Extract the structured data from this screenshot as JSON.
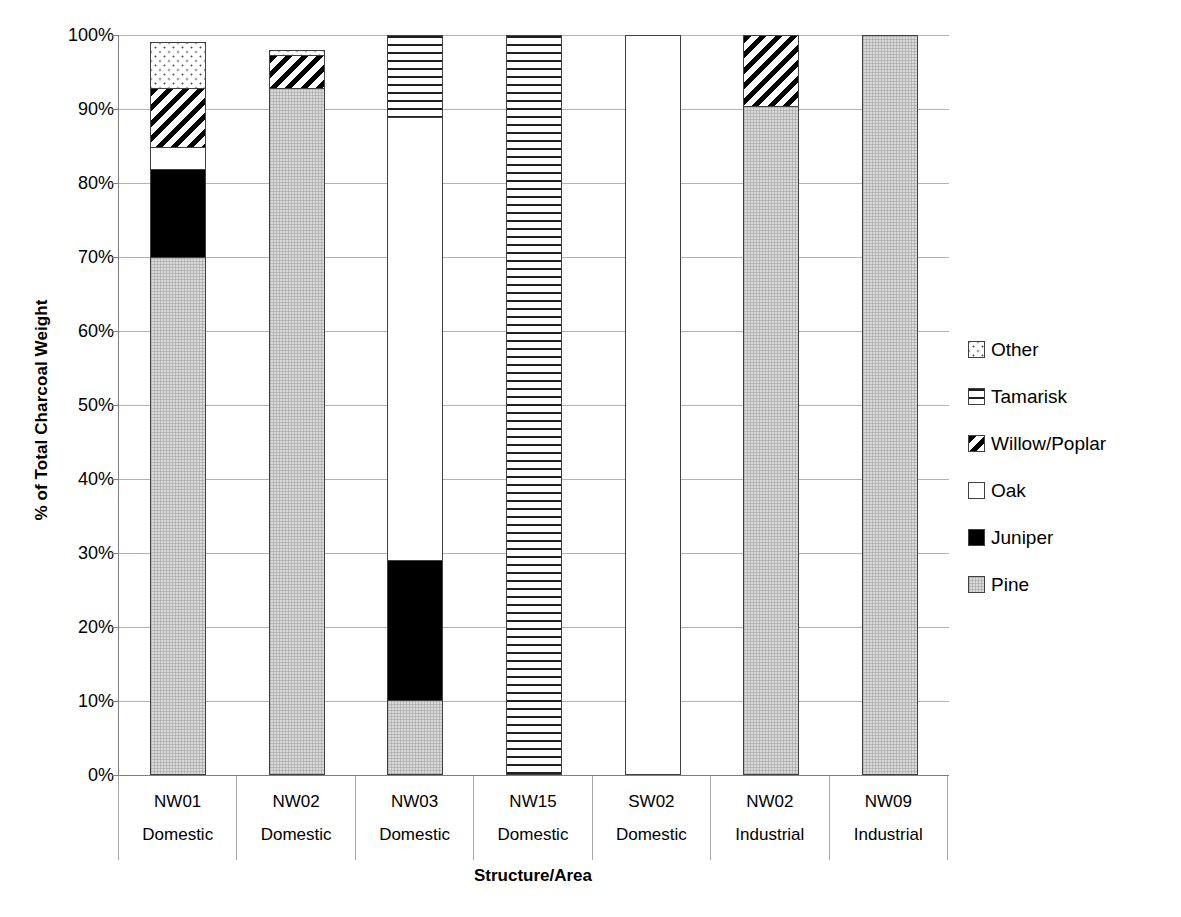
{
  "chart_data": {
    "type": "bar",
    "subtype": "stacked-percent",
    "title": "",
    "xlabel": "Structure/Area",
    "ylabel": "% of Total Charcoal Weight",
    "ylim": [
      0,
      100
    ],
    "ytick_labels": [
      "100%",
      "90%",
      "80%",
      "70%",
      "60%",
      "50%",
      "40%",
      "30%",
      "20%",
      "10%",
      "0%"
    ],
    "ytick_values": [
      100,
      90,
      80,
      70,
      60,
      50,
      40,
      30,
      20,
      10,
      0
    ],
    "grid": true,
    "legend_position": "right",
    "categories": [
      {
        "name": "NW01",
        "type": "Domestic"
      },
      {
        "name": "NW02",
        "type": "Domestic"
      },
      {
        "name": "NW03",
        "type": "Domestic"
      },
      {
        "name": "NW15",
        "type": "Domestic"
      },
      {
        "name": "SW02",
        "type": "Domestic"
      },
      {
        "name": "NW02",
        "type": "Industrial"
      },
      {
        "name": "NW09",
        "type": "Industrial"
      }
    ],
    "category_labels": [
      "NW01",
      "NW02",
      "NW03",
      "NW15",
      "SW02",
      "NW02",
      "NW09"
    ],
    "category_sublabels": [
      "Domestic",
      "Domestic",
      "Domestic",
      "Domestic",
      "Domestic",
      "Industrial",
      "Industrial"
    ],
    "series": [
      {
        "name": "Pine",
        "pattern": "fill-pine",
        "values": [
          70,
          93,
          10,
          0,
          0,
          90.5,
          100
        ]
      },
      {
        "name": "Juniper",
        "pattern": "fill-juniper",
        "values": [
          12,
          0,
          19,
          0,
          0,
          0,
          0
        ]
      },
      {
        "name": "Oak",
        "pattern": "fill-oak",
        "values": [
          3,
          0,
          60,
          0,
          100,
          0,
          0
        ]
      },
      {
        "name": "Willow/Poplar",
        "pattern": "fill-willow",
        "values": [
          8,
          4.5,
          0,
          0,
          0,
          9.5,
          0
        ]
      },
      {
        "name": "Tamarisk",
        "pattern": "fill-tamarisk",
        "values": [
          0,
          0,
          11,
          100,
          0,
          0,
          0
        ]
      },
      {
        "name": "Other",
        "pattern": "fill-other",
        "values": [
          6,
          0.5,
          0,
          0,
          0,
          0,
          0
        ]
      }
    ],
    "bar_totals": [
      99,
      98,
      100,
      100,
      100,
      100,
      100
    ]
  },
  "legend": {
    "items": [
      {
        "label": "Other",
        "pattern": "fill-other"
      },
      {
        "label": "Tamarisk",
        "pattern": "fill-tamarisk"
      },
      {
        "label": "Willow/Poplar",
        "pattern": "fill-willow"
      },
      {
        "label": "Oak",
        "pattern": "fill-oak"
      },
      {
        "label": "Juniper",
        "pattern": "fill-juniper"
      },
      {
        "label": "Pine",
        "pattern": "fill-pine"
      }
    ]
  },
  "colors": {
    "gridline": "#b3b3b3",
    "axis": "#7f7f7f",
    "bar_outline": "#404040",
    "pine": "#d9d9d9",
    "juniper": "#000000",
    "oak": "#ffffff",
    "background": "#ffffff"
  }
}
